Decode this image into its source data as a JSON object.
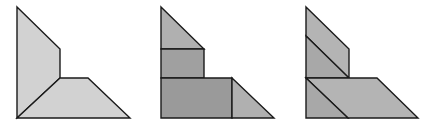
{
  "figure": {
    "stroke_color": "#1a1a1a",
    "stroke_width": 1.4,
    "shapes": [
      {
        "name": "shape-1-whole",
        "pieces": [
          {
            "name": "left-quadrilateral",
            "points": "17,7 60,49 60,78 17,118",
            "fill": "#d2d2d2"
          },
          {
            "name": "bottom-trapezoid",
            "points": "17,118 60,78 88,78 130,118",
            "fill": "#d2d2d2"
          }
        ]
      },
      {
        "name": "shape-2-rect-partition",
        "pieces": [
          {
            "name": "top-triangle",
            "points": "161,7 204,49 161,49",
            "fill": "#b0b0b0"
          },
          {
            "name": "middle-rectangle",
            "points": "161,49 204,49 204,78 161,78",
            "fill": "#a0a0a0"
          },
          {
            "name": "bottom-rectangle",
            "points": "161,78 232,78 232,118 161,118",
            "fill": "#9a9a9a"
          },
          {
            "name": "right-triangle",
            "points": "232,78 274,118 232,118",
            "fill": "#b0b0b0"
          }
        ]
      },
      {
        "name": "shape-3-diagonal-partition",
        "pieces": [
          {
            "name": "top-parallelogram",
            "points": "306,7 349,49 349,78 306,36",
            "fill": "#b4b4b4"
          },
          {
            "name": "upper-triangle",
            "points": "306,36 349,78 306,78",
            "fill": "#a8a8a8"
          },
          {
            "name": "bottom-parallelogram",
            "points": "306,78 377,78 418,118 348,118",
            "fill": "#b4b4b4"
          },
          {
            "name": "lower-triangle",
            "points": "306,78 348,118 306,118",
            "fill": "#a8a8a8"
          }
        ]
      }
    ]
  }
}
